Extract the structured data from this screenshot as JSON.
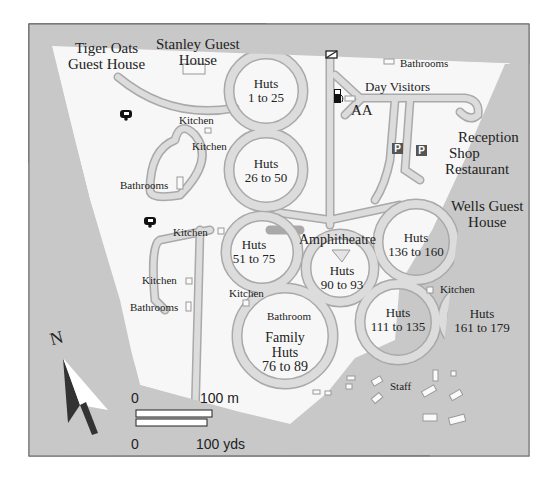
{
  "map": {
    "colors": {
      "background": "#c8c8c8",
      "land": "#f7f7f7",
      "road": "#dcdcdc",
      "road_edge": "#a9a9a9",
      "frame": "#666666"
    },
    "labels": {
      "tiger_oats_1": "Tiger Oats",
      "tiger_oats_2": "Guest House",
      "stanley_1": "Stanley Guest",
      "stanley_2": "House",
      "bathrooms_top": "Bathrooms",
      "day_visitors": "Day Visitors",
      "aa": "AA",
      "reception": "Reception",
      "shop": "Shop",
      "restaurant": "Restaurant",
      "wells_1": "Wells Guest",
      "wells_2": "House",
      "kitchen_1": "Kitchen",
      "kitchen_2": "Kitchen",
      "kitchen_3": "Kitchen",
      "kitchen_4": "Kitchen",
      "kitchen_5": "Kitchen",
      "kitchen_6": "Kitchen",
      "bathrooms_left": "Bathrooms",
      "bathrooms_low": "Bathrooms",
      "bathroom_family": "Bathroom",
      "amphitheatre": "Amphitheatre",
      "staff": "Staff",
      "huts_1_25": [
        "Huts",
        "1 to 25"
      ],
      "huts_26_50": [
        "Huts",
        "26 to 50"
      ],
      "huts_51_75": [
        "Huts",
        "51 to 75"
      ],
      "huts_90_93": [
        "Huts",
        "90 to 93"
      ],
      "huts_136_160": [
        "Huts",
        "136 to 160"
      ],
      "huts_111_135": [
        "Huts",
        "111 to 135"
      ],
      "huts_161_179": [
        "Huts",
        "161 to 179"
      ],
      "family_huts": [
        "Family",
        "Huts",
        "76 to 89"
      ]
    },
    "north": "N",
    "scale": {
      "m_start": "0",
      "m_end": "100 m",
      "yd_start": "0",
      "yd_end": "100 yds"
    },
    "icons": [
      "caravan-icon",
      "caravan-icon",
      "fuel-pump-icon",
      "parking-icon",
      "parking-icon",
      "gate-icon",
      "north-arrow-icon"
    ]
  }
}
